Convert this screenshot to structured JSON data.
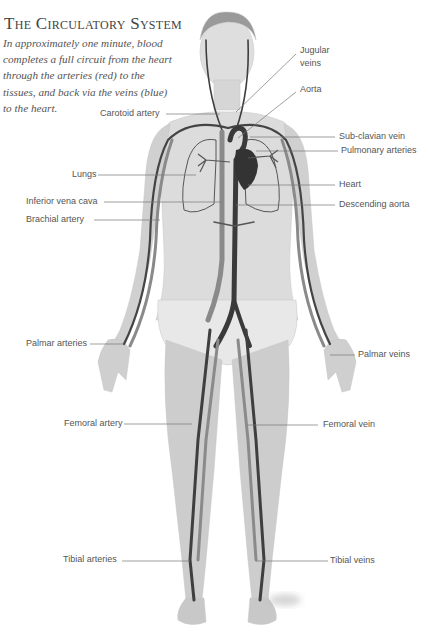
{
  "header": {
    "title": "The Circulatory System",
    "intro": "In approximately one minute, blood completes a full circuit from the heart through the arteries (red) to the tissues, and back via the veins (blue) to the heart."
  },
  "colors": {
    "skin": "#d9d9d9",
    "skin_shade": "#bdbdbd",
    "vessel_dark": "#3f3f3f",
    "vessel_mid": "#8a8a8a",
    "leader_line": "#777777",
    "text": "#555555"
  },
  "labels": {
    "left": [
      {
        "text": "Carotoid artery",
        "x": 100,
        "y": 108
      },
      {
        "text": "Lungs",
        "x": 72,
        "y": 169
      },
      {
        "text": "Inferior vena cava",
        "x": 26,
        "y": 196
      },
      {
        "text": "Brachial artery",
        "x": 26,
        "y": 214
      },
      {
        "text": "Palmar arteries",
        "x": 26,
        "y": 338
      },
      {
        "text": "Femoral artery",
        "x": 64,
        "y": 418
      },
      {
        "text": "Tibial arteries",
        "x": 63,
        "y": 554
      }
    ],
    "right": [
      {
        "text": "Jugular",
        "x": 300,
        "y": 45
      },
      {
        "text": "veins",
        "x": 300,
        "y": 58
      },
      {
        "text": "Aorta",
        "x": 300,
        "y": 84
      },
      {
        "text": "Sub-clavian vein",
        "x": 339,
        "y": 131
      },
      {
        "text": "Pulmonary arteries",
        "x": 341,
        "y": 145
      },
      {
        "text": "Heart",
        "x": 339,
        "y": 179
      },
      {
        "text": "Descending aorta",
        "x": 339,
        "y": 199
      },
      {
        "text": "Palmar veins",
        "x": 358,
        "y": 349
      },
      {
        "text": "Femoral vein",
        "x": 323,
        "y": 419
      },
      {
        "text": "Tibial veins",
        "x": 330,
        "y": 555
      }
    ]
  }
}
